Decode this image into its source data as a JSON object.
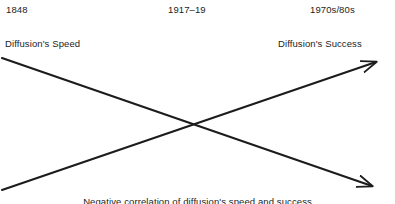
{
  "diagram": {
    "type": "crossing-arrows",
    "title_visible": false,
    "background_color": "#ffffff",
    "line_color": "#1c1c1c",
    "timeline": [
      {
        "id": "start",
        "label": "1848"
      },
      {
        "id": "middle",
        "label": "1917–19"
      },
      {
        "id": "end",
        "label": "1970s/80s"
      }
    ],
    "series": [
      {
        "id": "speed",
        "label": "Diffusion's Speed",
        "direction": "descending",
        "arrow_head": "right",
        "from": {
          "x": 2,
          "y": 58
        },
        "to": {
          "x": 378,
          "y": 188
        }
      },
      {
        "id": "success",
        "label": "Diffusion's Success",
        "direction": "ascending",
        "arrow_head": "right",
        "from": {
          "x": 2,
          "y": 190
        },
        "to": {
          "x": 382,
          "y": 60
        }
      }
    ],
    "crossing_point": {
      "x": 198,
      "y": 125
    },
    "caption": "Negative correlation of diffusion's speed and success"
  }
}
